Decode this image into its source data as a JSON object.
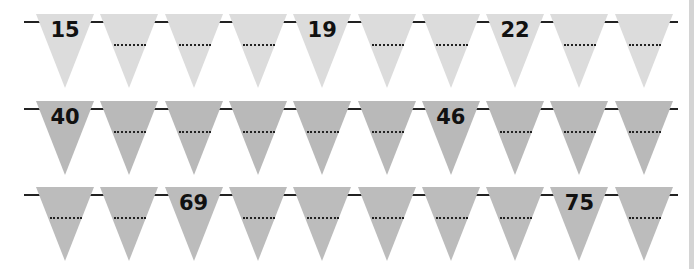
{
  "rows": [
    {
      "color": "#dcdcdc",
      "flags": [
        "15",
        "",
        "",
        "",
        "19",
        "",
        "",
        "22",
        "",
        ""
      ]
    },
    {
      "color": "#b9b9b9",
      "flags": [
        "40",
        "",
        "",
        "",
        "",
        "",
        "46",
        "",
        "",
        ""
      ]
    },
    {
      "color": "#bcbcbc",
      "flags": [
        "",
        "",
        "69",
        "",
        "",
        "",
        "",
        "",
        "75",
        ""
      ]
    }
  ],
  "blank_placeholder": "......"
}
